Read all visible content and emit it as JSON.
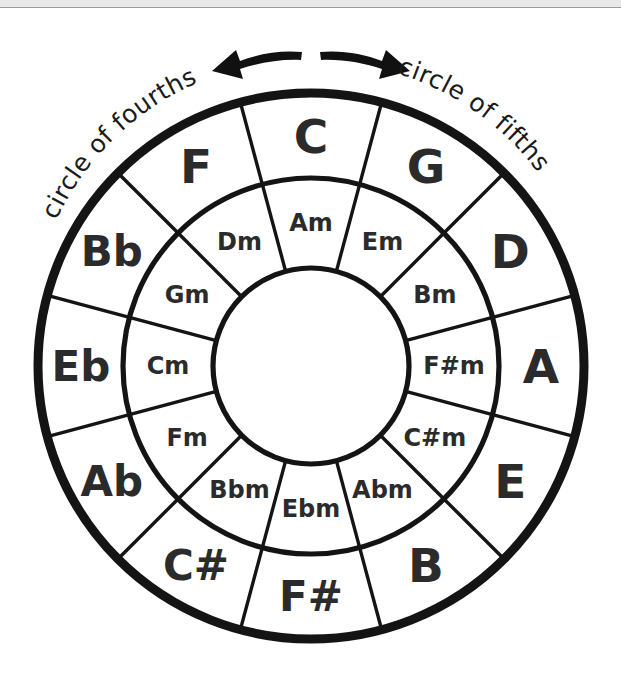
{
  "figure": {
    "name": "circle-of-fifths-diagram",
    "background": "#ffffff",
    "line_color": "#141414",
    "text_color": "#2b2b2b"
  },
  "captions": {
    "left": "circle of fourths",
    "right": "circle of fifths"
  },
  "arrows": {
    "left": "arrow-left",
    "right": "arrow-right"
  },
  "geometry": {
    "center_x": 311,
    "center_y": 366,
    "outer_radius": 273,
    "mid_radius": 188,
    "hub_radius": 98,
    "sectors": 12,
    "sector_degrees": 30,
    "major_label_radius": 230,
    "minor_label_radius": 143
  },
  "chart_data": {
    "type": "pie",
    "legend": [
      "circle of fourths",
      "circle of fifths"
    ],
    "categories": [
      "C",
      "G",
      "D",
      "A",
      "E",
      "B",
      "F#",
      "C#",
      "Ab",
      "Eb",
      "Bb",
      "F"
    ],
    "values": [
      30,
      30,
      30,
      30,
      30,
      30,
      30,
      30,
      30,
      30,
      30,
      30
    ],
    "series": [
      {
        "name": "major keys (outer ring)",
        "labels": [
          "C",
          "G",
          "D",
          "A",
          "E",
          "B",
          "F#",
          "C#",
          "Ab",
          "Eb",
          "Bb",
          "F"
        ]
      },
      {
        "name": "relative minor keys (inner ring)",
        "labels": [
          "Am",
          "Em",
          "Bm",
          "F#m",
          "C#m",
          "Abm",
          "Ebm",
          "Bbm",
          "Fm",
          "Cm",
          "Gm",
          "Dm"
        ]
      }
    ]
  },
  "rings": {
    "major": [
      {
        "label": "C",
        "angle": 0,
        "narrow": false
      },
      {
        "label": "G",
        "angle": 30,
        "narrow": false
      },
      {
        "label": "D",
        "angle": 60,
        "narrow": false
      },
      {
        "label": "A",
        "angle": 90,
        "narrow": false
      },
      {
        "label": "E",
        "angle": 120,
        "narrow": false
      },
      {
        "label": "B",
        "angle": 150,
        "narrow": false
      },
      {
        "label": "F#",
        "angle": 180,
        "narrow": true
      },
      {
        "label": "C#",
        "angle": 210,
        "narrow": true
      },
      {
        "label": "Ab",
        "angle": 240,
        "narrow": true
      },
      {
        "label": "Eb",
        "angle": 270,
        "narrow": true
      },
      {
        "label": "Bb",
        "angle": 300,
        "narrow": true
      },
      {
        "label": "F",
        "angle": 330,
        "narrow": false
      }
    ],
    "minor": [
      {
        "label": "Am",
        "angle": 0
      },
      {
        "label": "Em",
        "angle": 30
      },
      {
        "label": "Bm",
        "angle": 60
      },
      {
        "label": "F#m",
        "angle": 90
      },
      {
        "label": "C#m",
        "angle": 120
      },
      {
        "label": "Abm",
        "angle": 150
      },
      {
        "label": "Ebm",
        "angle": 180
      },
      {
        "label": "Bbm",
        "angle": 210
      },
      {
        "label": "Fm",
        "angle": 240
      },
      {
        "label": "Cm",
        "angle": 270
      },
      {
        "label": "Gm",
        "angle": 300
      },
      {
        "label": "Dm",
        "angle": 330
      }
    ]
  }
}
